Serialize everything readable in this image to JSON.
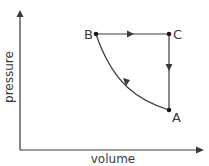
{
  "diagram": {
    "type": "pressure-volume cycle",
    "axes": {
      "x_label": "volume",
      "y_label": "pressure"
    },
    "points": [
      {
        "name": "A",
        "label": "A",
        "x": 169,
        "y": 110
      },
      {
        "name": "B",
        "label": "B",
        "x": 96,
        "y": 34
      },
      {
        "name": "C",
        "label": "C",
        "x": 169,
        "y": 34
      }
    ],
    "processes": [
      {
        "from": "B",
        "to": "C",
        "shape": "straight",
        "direction": "right"
      },
      {
        "from": "C",
        "to": "A",
        "shape": "straight",
        "direction": "down"
      },
      {
        "from": "A",
        "to": "B",
        "shape": "curve",
        "direction": "up-left"
      }
    ],
    "colors": {
      "line": "#3a3a3a",
      "text": "#3a3a3a",
      "background": "#ffffff"
    }
  }
}
